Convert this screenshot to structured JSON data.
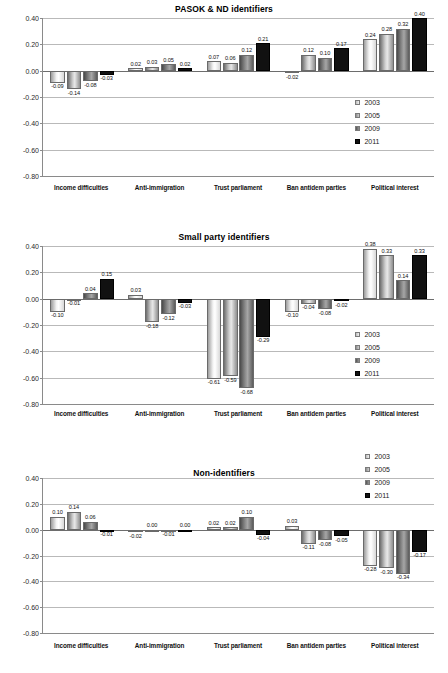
{
  "figure": {
    "series_names": [
      "2003",
      "2005",
      "2009",
      "2011"
    ],
    "categories": [
      "Income difficulties",
      "Anti-immigration",
      "Trust parliament",
      "Ban antidem parties",
      "Political interest"
    ],
    "y_ticks": [
      "0.40",
      "0.20",
      "0.00",
      "-0.20",
      "-0.40",
      "-0.60",
      "-0.80"
    ]
  },
  "chart_data": [
    {
      "type": "bar",
      "title": "PASOK & ND identifiers",
      "xlabel": "",
      "ylabel": "",
      "ylim": [
        -0.8,
        0.4
      ],
      "grid": true,
      "legend_position": "right-inside",
      "categories": [
        "Income difficulties",
        "Anti-immigration",
        "Trust parliament",
        "Ban antidem parties",
        "Political interest"
      ],
      "series": [
        {
          "name": "2003",
          "values": [
            -0.09,
            0.02,
            0.07,
            -0.02,
            0.24
          ]
        },
        {
          "name": "2005",
          "values": [
            -0.14,
            0.03,
            0.06,
            0.12,
            0.28
          ]
        },
        {
          "name": "2009",
          "values": [
            -0.08,
            0.05,
            0.12,
            0.1,
            0.32
          ]
        },
        {
          "name": "2011",
          "values": [
            -0.03,
            0.02,
            0.21,
            0.17,
            0.4
          ]
        }
      ],
      "labels": [
        [
          "-0.09",
          "0.02",
          "0.07",
          "-0.02",
          "0.24"
        ],
        [
          "-0.14",
          "0.03",
          "0.06",
          "0.12",
          "0.28"
        ],
        [
          "-0.08",
          "0.05",
          "0.12",
          "0.10",
          "0.32"
        ],
        [
          "-0.03",
          "0.02",
          "0.21",
          "0.17",
          "0.40"
        ]
      ]
    },
    {
      "type": "bar",
      "title": "Small party identifiers",
      "xlabel": "",
      "ylabel": "",
      "ylim": [
        -0.8,
        0.4
      ],
      "grid": true,
      "legend_position": "right-inside",
      "categories": [
        "Income difficulties",
        "Anti-immigration",
        "Trust parliament",
        "Ban antidem parties",
        "Political interest"
      ],
      "series": [
        {
          "name": "2003",
          "values": [
            -0.1,
            0.03,
            -0.61,
            -0.1,
            0.38
          ]
        },
        {
          "name": "2005",
          "values": [
            -0.01,
            -0.18,
            -0.59,
            -0.04,
            0.33
          ]
        },
        {
          "name": "2009",
          "values": [
            0.04,
            -0.12,
            -0.68,
            -0.08,
            0.14
          ]
        },
        {
          "name": "2011",
          "values": [
            0.15,
            -0.03,
            -0.29,
            -0.02,
            0.33
          ]
        }
      ],
      "labels": [
        [
          "-0.10",
          "0.03",
          "-0.61",
          "-0.10",
          "0.38"
        ],
        [
          "-0.01",
          "-0.18",
          "-0.59",
          "-0.04",
          "0.33"
        ],
        [
          "0.04",
          "-0.12",
          "-0.68",
          "-0.08",
          "0.14"
        ],
        [
          "0.15",
          "-0.03",
          "-0.29",
          "-0.02",
          "0.33"
        ]
      ]
    },
    {
      "type": "bar",
      "title": "Non-identifiers",
      "xlabel": "",
      "ylabel": "",
      "ylim": [
        -0.8,
        0.4
      ],
      "grid": true,
      "legend_position": "top-right",
      "categories": [
        "Income difficulties",
        "Anti-immigration",
        "Trust parliament",
        "Ban antidem parties",
        "Political interest"
      ],
      "series": [
        {
          "name": "2003",
          "values": [
            0.1,
            -0.02,
            0.02,
            0.03,
            -0.28
          ]
        },
        {
          "name": "2005",
          "values": [
            0.14,
            0.0,
            0.02,
            -0.11,
            -0.3
          ]
        },
        {
          "name": "2009",
          "values": [
            0.06,
            -0.01,
            0.1,
            -0.08,
            -0.34
          ]
        },
        {
          "name": "2011",
          "values": [
            -0.01,
            0.0,
            -0.04,
            -0.05,
            -0.17
          ]
        }
      ],
      "labels": [
        [
          "0.10",
          "-0.02",
          "0.02",
          "0.03",
          "-0.28"
        ],
        [
          "0.14",
          "0.00",
          "0.02",
          "-0.11",
          "-0.30"
        ],
        [
          "0.06",
          "-0.01",
          "0.10",
          "-0.08",
          "-0.34"
        ],
        [
          "-0.01",
          "0.00",
          "-0.04",
          "-0.05",
          "-0.17"
        ]
      ]
    }
  ]
}
